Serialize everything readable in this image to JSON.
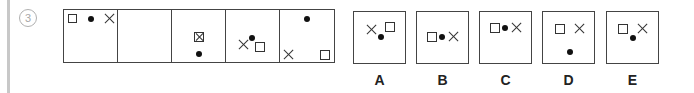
{
  "question": {
    "number": "3",
    "sequence_cells": [
      {
        "index": 1,
        "symbols": [
          "square-top-left",
          "dot-top-center",
          "x-top-right"
        ]
      },
      {
        "index": 2,
        "symbols": []
      },
      {
        "index": 3,
        "symbols": [
          "square-with-x-center",
          "dot-below"
        ]
      },
      {
        "index": 4,
        "symbols": [
          "x-left",
          "dot-above",
          "square-right"
        ]
      },
      {
        "index": 5,
        "symbols": [
          "dot-top",
          "x-bottom-left",
          "square-bottom-right"
        ]
      }
    ],
    "options": [
      {
        "label": "A"
      },
      {
        "label": "B"
      },
      {
        "label": "C"
      },
      {
        "label": "D"
      },
      {
        "label": "E"
      }
    ]
  },
  "colors": {
    "line": "#444444",
    "rule": "#c8c8c8",
    "qnum": "#a8a8a8"
  }
}
